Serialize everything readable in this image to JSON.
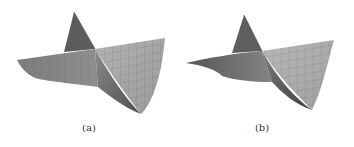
{
  "figure": {
    "panels": [
      {
        "id": "a",
        "caption": "(a)",
        "description": "3D meshed surface with sharp peak and deep curved trough"
      },
      {
        "id": "b",
        "caption": "(b)",
        "description": "3D meshed surface with sharp peak and flatter trough"
      }
    ],
    "colors": {
      "surface_light": "#a9a9a9",
      "surface_mid": "#8a8a8a",
      "surface_dark": "#555555",
      "mesh_line": "#6e6e6e",
      "background": "#ffffff"
    }
  }
}
